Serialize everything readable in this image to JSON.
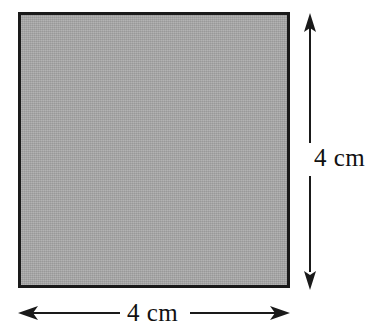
{
  "figure": {
    "type": "geometric-diagram",
    "shape": "square",
    "background_color": "#ffffff",
    "fill_color": "#a8a8a8",
    "stroke_color": "#1a1a1a",
    "dimensions": {
      "width_label": "4 cm",
      "height_label": "4 cm",
      "unit": "cm",
      "value": 4
    },
    "annotations": {
      "width_arrow": "double-headed-horizontal-arrow",
      "height_arrow": "double-headed-vertical-arrow"
    }
  }
}
